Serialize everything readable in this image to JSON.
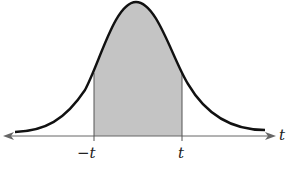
{
  "figure": {
    "labels": {
      "left_bound": "−t",
      "right_bound": "t",
      "axis": "t"
    },
    "colors": {
      "curve": "#111111",
      "shade": "#c4c4c4",
      "axis": "#666666",
      "bounds": "#555555"
    }
  }
}
